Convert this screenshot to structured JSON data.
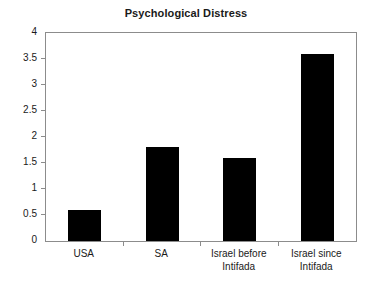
{
  "chart_data": {
    "type": "bar",
    "title": "Psychological Distress",
    "xlabel": "",
    "ylabel": "",
    "categories": [
      "USA",
      "SA",
      "Israel before Intifada",
      "Israel since Intifada"
    ],
    "category_lines": [
      [
        "USA"
      ],
      [
        "SA"
      ],
      [
        "Israel before",
        "Intifada"
      ],
      [
        "Israel since",
        "Intifada"
      ]
    ],
    "values": [
      0.6,
      1.81,
      1.6,
      3.6
    ],
    "ylim": [
      0,
      4
    ],
    "yticks": [
      0,
      0.5,
      1,
      1.5,
      2,
      2.5,
      3,
      3.5,
      4
    ],
    "ytick_labels": [
      "0",
      "0.5",
      "1",
      "1.5",
      "2",
      "2.5",
      "3",
      "3.5",
      "4"
    ],
    "grid": false,
    "legend": null,
    "bar_color": "#000000",
    "axis_color": "#8c8c8c",
    "text_color": "#1a1a1a"
  }
}
